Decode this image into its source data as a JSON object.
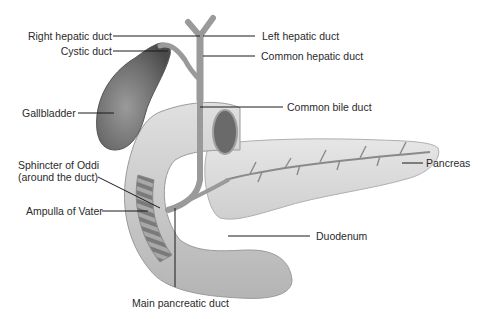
{
  "diagram": {
    "labels": {
      "right_hepatic_duct": "Right hepatic duct",
      "cystic_duct": "Cystic duct",
      "gallbladder": "Gallbladder",
      "sphincter_line1": "Sphincter of Oddi",
      "sphincter_line2": "(around the duct)",
      "ampulla": "Ampulla of Vater",
      "main_pancreatic_duct": "Main pancreatic duct",
      "left_hepatic_duct": "Left hepatic duct",
      "common_hepatic_duct": "Common hepatic duct",
      "common_bile_duct": "Common bile duct",
      "pancreas": "Pancreas",
      "duodenum": "Duodenum"
    },
    "colors": {
      "background": "#ffffff",
      "label_text": "#2a2a2a",
      "leader_line": "#1a1a1a",
      "gallbladder": "#6e6e6e",
      "duodenum": "#c8c8c8",
      "pancreas": "#dcdcdc",
      "duct": "#9a9a9a"
    }
  }
}
